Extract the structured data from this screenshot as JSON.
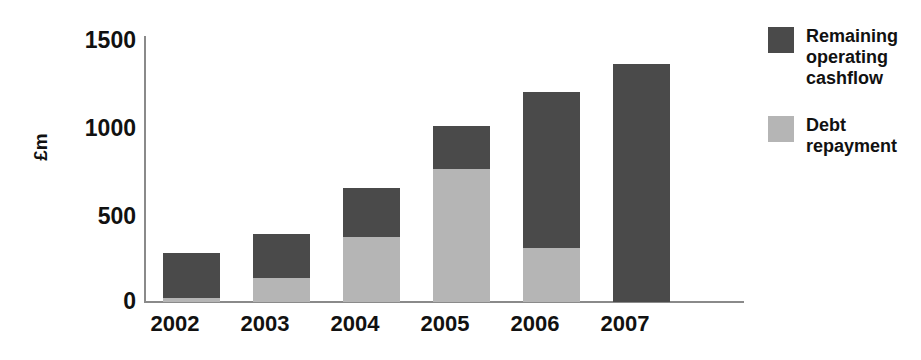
{
  "chart_data": {
    "type": "bar",
    "stacked": true,
    "title": "",
    "xlabel": "",
    "ylabel": "£m",
    "ylim": [
      0,
      1500
    ],
    "yticks": [
      "0",
      "500",
      "1000",
      "1500"
    ],
    "grid": false,
    "legend_position": "right",
    "categories": [
      "2002",
      "2003",
      "2004",
      "2005",
      "2006",
      "2007"
    ],
    "series": [
      {
        "name": "Debt repayment",
        "color": "#b5b5b5",
        "values": [
          20,
          137,
          366,
          750,
          303,
          0
        ]
      },
      {
        "name": "Remaining operating cashflow",
        "color": "#4a4a4a",
        "values": [
          255,
          247,
          275,
          240,
          882,
          1340
        ]
      }
    ],
    "totals": [
      275,
      384,
      641,
      990,
      1185,
      1340
    ]
  },
  "axes": {
    "y_title": "£m",
    "y_ticks": [
      {
        "label": "1500",
        "value": 1500
      },
      {
        "label": "1000",
        "value": 1000
      },
      {
        "label": "500",
        "value": 500
      },
      {
        "label": "0",
        "value": 0
      }
    ],
    "x_ticks": [
      {
        "label": "2002"
      },
      {
        "label": "2003"
      },
      {
        "label": "2004"
      },
      {
        "label": "2005"
      },
      {
        "label": "2006"
      },
      {
        "label": "2007"
      }
    ]
  },
  "legend": {
    "entries": [
      {
        "label": "Remaining operating cashflow",
        "color": "#4a4a4a"
      },
      {
        "label": "Debt repayment",
        "color": "#b5b5b5"
      }
    ]
  },
  "colors": {
    "remaining_operating_cashflow": "#4a4a4a",
    "debt_repayment": "#b5b5b5",
    "axis": "#8a8a8a",
    "text": "#111111",
    "background": "#ffffff"
  }
}
